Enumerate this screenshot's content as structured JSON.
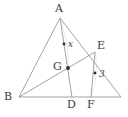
{
  "figure": {
    "type": "euclidean-geometry-diagram",
    "canvas": {
      "width": 128,
      "height": 117
    },
    "stroke_color": "#8a8a8a",
    "dotted_color": "#b0b0b0",
    "label_color": "#3a3a3a",
    "point_color": "#2a2a2a",
    "points": [
      {
        "id": "A",
        "label": "A",
        "x": 60,
        "y": 18,
        "label_x": 55,
        "label_y": 3,
        "marker": false
      },
      {
        "id": "B",
        "label": "B",
        "x": 19,
        "y": 97,
        "label_x": 4,
        "label_y": 91,
        "marker": false
      },
      {
        "id": "C",
        "label": "",
        "x": 121,
        "y": 97,
        "label_x": 121,
        "label_y": 97,
        "marker": false
      },
      {
        "id": "D",
        "label": "D",
        "x": 72,
        "y": 97,
        "label_x": 67,
        "label_y": 100,
        "marker": false
      },
      {
        "id": "E",
        "label": "E",
        "x": 95,
        "y": 52,
        "label_x": 97,
        "label_y": 40,
        "marker": false
      },
      {
        "id": "F",
        "label": "F",
        "x": 91,
        "y": 97,
        "label_x": 87,
        "label_y": 100,
        "marker": false
      },
      {
        "id": "G",
        "label": "G",
        "x": 68,
        "y": 68,
        "label_x": 54,
        "label_y": 61,
        "marker": true
      },
      {
        "id": "Mx",
        "label": "",
        "x": 64,
        "y": 44,
        "label_x": 64,
        "label_y": 44,
        "marker": true
      },
      {
        "id": "M3",
        "label": "",
        "x": 95,
        "y": 73,
        "label_x": 95,
        "label_y": 73,
        "marker": true
      }
    ],
    "segments": [
      {
        "name": "side-AB",
        "from": "A",
        "to": "B",
        "style": "solid"
      },
      {
        "name": "side-BC",
        "from": "B",
        "to": "C",
        "style": "solid"
      },
      {
        "name": "side-AC",
        "from": "A",
        "to": "C",
        "style": "solid"
      },
      {
        "name": "cevian-AD",
        "from": "A",
        "to": "D",
        "style": "solid"
      },
      {
        "name": "cevian-BE",
        "from": "B",
        "to": "E",
        "style": "solid"
      },
      {
        "name": "segment-EF",
        "from": "E",
        "to": "F",
        "style": "solid"
      }
    ],
    "measure_arcs": [
      {
        "name": "arc-AG",
        "from": "A",
        "to": "G",
        "bulge": 5,
        "style": "dotted"
      },
      {
        "name": "arc-EF",
        "from": "E",
        "to": "F",
        "bulge": 4,
        "style": "dotted"
      }
    ],
    "measure_labels": [
      {
        "id": "x",
        "text": "x",
        "x": 68,
        "y": 40,
        "measures": "AG"
      },
      {
        "id": "three",
        "text": "3",
        "x": 99,
        "y": 70,
        "measures": "EF"
      }
    ]
  }
}
